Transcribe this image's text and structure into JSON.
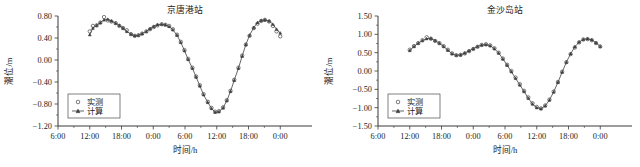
{
  "figure": {
    "panel_count": 2,
    "background": "#ffffff",
    "axis_color": "#3a3a3a",
    "curve_color": "#555555"
  },
  "chart_data": [
    {
      "type": "line",
      "title": "京唐港站",
      "xlabel": "时间/h",
      "ylabel": "潮位/m",
      "grid": false,
      "legend_position": "lower-left",
      "xlim": [
        0,
        48
      ],
      "ylim": [
        -1.2,
        0.8
      ],
      "yticks": [
        "0.80",
        "0.40",
        "0.00",
        "−0.40",
        "−0.80",
        "−1.20"
      ],
      "ytick_values": [
        0.8,
        0.4,
        0.0,
        -0.4,
        -0.8,
        -1.2
      ],
      "xticks": [
        "6:00",
        "12:00",
        "18:00",
        "0:00",
        "6:00",
        "12:00",
        "18:00",
        "0:00"
      ],
      "xtick_values": [
        0,
        6,
        12,
        18,
        24,
        30,
        36,
        42
      ],
      "series": [
        {
          "name": "实测",
          "marker": "open-circle",
          "style": "points",
          "x": [
            6.0,
            6.6,
            7.3,
            8.0,
            8.7,
            9.4,
            10.1,
            10.9,
            11.6,
            12.3,
            13.0,
            13.8,
            14.5,
            15.2,
            15.9,
            16.7,
            17.4,
            18.1,
            18.8,
            19.6,
            20.3,
            21.0,
            21.7,
            22.5,
            23.2,
            23.9,
            24.6,
            25.4,
            26.1,
            26.8,
            27.5,
            28.3,
            29.0,
            29.7,
            30.4,
            31.2,
            31.9,
            32.6,
            33.3,
            34.1,
            34.8,
            35.5,
            36.2,
            37.0,
            37.7,
            38.4,
            39.1,
            39.9,
            40.6,
            41.3,
            42.0
          ],
          "y": [
            0.52,
            0.62,
            0.63,
            0.68,
            0.78,
            0.72,
            0.7,
            0.67,
            0.62,
            0.58,
            0.54,
            0.47,
            0.44,
            0.45,
            0.48,
            0.52,
            0.56,
            0.6,
            0.63,
            0.65,
            0.64,
            0.62,
            0.56,
            0.46,
            0.33,
            0.18,
            0.02,
            -0.14,
            -0.3,
            -0.46,
            -0.62,
            -0.76,
            -0.87,
            -0.94,
            -0.93,
            -0.86,
            -0.73,
            -0.56,
            -0.36,
            -0.14,
            0.08,
            0.28,
            0.44,
            0.58,
            0.66,
            0.71,
            0.73,
            0.7,
            0.62,
            0.52,
            0.43
          ]
        },
        {
          "name": "计算",
          "marker": "filled-triangle",
          "style": "line-with-markers",
          "x": [
            6.0,
            6.6,
            7.3,
            8.0,
            8.7,
            9.4,
            10.1,
            10.9,
            11.6,
            12.3,
            13.0,
            13.8,
            14.5,
            15.2,
            15.9,
            16.7,
            17.4,
            18.1,
            18.8,
            19.6,
            20.3,
            21.0,
            21.7,
            22.5,
            23.2,
            23.9,
            24.6,
            25.4,
            26.1,
            26.8,
            27.5,
            28.3,
            29.0,
            29.7,
            30.4,
            31.2,
            31.9,
            32.6,
            33.3,
            34.1,
            34.8,
            35.5,
            36.2,
            37.0,
            37.7,
            38.4,
            39.1,
            39.9,
            40.6,
            41.3,
            42.0
          ],
          "y": [
            0.46,
            0.58,
            0.63,
            0.68,
            0.73,
            0.74,
            0.71,
            0.67,
            0.63,
            0.58,
            0.52,
            0.47,
            0.44,
            0.45,
            0.48,
            0.52,
            0.57,
            0.61,
            0.64,
            0.65,
            0.64,
            0.61,
            0.55,
            0.45,
            0.32,
            0.17,
            0.01,
            -0.15,
            -0.31,
            -0.47,
            -0.63,
            -0.77,
            -0.88,
            -0.95,
            -0.94,
            -0.87,
            -0.74,
            -0.57,
            -0.37,
            -0.15,
            0.07,
            0.28,
            0.45,
            0.59,
            0.68,
            0.72,
            0.73,
            0.71,
            0.65,
            0.56,
            0.49
          ]
        }
      ]
    },
    {
      "type": "line",
      "title": "金沙岛站",
      "xlabel": "时间/h",
      "ylabel": "潮位/m",
      "grid": false,
      "legend_position": "lower-left",
      "xlim": [
        0,
        48
      ],
      "ylim": [
        -1.5,
        1.5
      ],
      "yticks": [
        "1.50",
        "1.00",
        "0.50",
        "0.00",
        "−0.50",
        "−1.00",
        "−1.50"
      ],
      "ytick_values": [
        1.5,
        1.0,
        0.5,
        0.0,
        -0.5,
        -1.0,
        -1.5
      ],
      "xticks": [
        "6:00",
        "12:00",
        "18:00",
        "0:00",
        "6:00",
        "12:00",
        "18:00",
        "0:00"
      ],
      "xtick_values": [
        0,
        6,
        12,
        18,
        24,
        30,
        36,
        42
      ],
      "series": [
        {
          "name": "实测",
          "marker": "open-circle",
          "style": "points",
          "x": [
            6.0,
            6.8,
            7.6,
            8.4,
            9.2,
            10.0,
            10.8,
            11.6,
            12.4,
            13.2,
            14.0,
            14.8,
            15.6,
            16.4,
            17.2,
            18.0,
            18.8,
            19.6,
            20.4,
            21.2,
            22.0,
            22.8,
            23.6,
            24.4,
            25.2,
            26.0,
            26.8,
            27.6,
            28.4,
            29.2,
            30.0,
            30.8,
            31.6,
            32.4,
            33.2,
            34.0,
            34.8,
            35.6,
            36.4,
            37.2,
            38.0,
            38.8,
            39.6,
            40.4,
            41.2,
            42.0
          ],
          "y": [
            0.58,
            0.68,
            0.76,
            0.84,
            0.92,
            0.88,
            0.82,
            0.76,
            0.68,
            0.58,
            0.48,
            0.43,
            0.44,
            0.48,
            0.54,
            0.6,
            0.66,
            0.71,
            0.73,
            0.7,
            0.62,
            0.5,
            0.34,
            0.17,
            0.0,
            -0.18,
            -0.36,
            -0.54,
            -0.72,
            -0.88,
            -0.98,
            -1.02,
            -0.94,
            -0.78,
            -0.56,
            -0.3,
            -0.02,
            0.24,
            0.46,
            0.64,
            0.78,
            0.86,
            0.87,
            0.84,
            0.76,
            0.67
          ]
        },
        {
          "name": "计算",
          "marker": "filled-triangle",
          "style": "line-with-markers",
          "x": [
            6.0,
            6.8,
            7.6,
            8.4,
            9.2,
            10.0,
            10.8,
            11.6,
            12.4,
            13.2,
            14.0,
            14.8,
            15.6,
            16.4,
            17.2,
            18.0,
            18.8,
            19.6,
            20.4,
            21.2,
            22.0,
            22.8,
            23.6,
            24.4,
            25.2,
            26.0,
            26.8,
            27.6,
            28.4,
            29.2,
            30.0,
            30.8,
            31.6,
            32.4,
            33.2,
            34.0,
            34.8,
            35.6,
            36.4,
            37.2,
            38.0,
            38.8,
            39.6,
            40.4,
            41.2,
            42.0
          ],
          "y": [
            0.56,
            0.67,
            0.76,
            0.83,
            0.88,
            0.89,
            0.83,
            0.76,
            0.67,
            0.57,
            0.47,
            0.43,
            0.44,
            0.49,
            0.55,
            0.61,
            0.67,
            0.71,
            0.72,
            0.69,
            0.61,
            0.49,
            0.33,
            0.16,
            -0.02,
            -0.2,
            -0.38,
            -0.56,
            -0.74,
            -0.9,
            -1.0,
            -1.03,
            -0.95,
            -0.79,
            -0.57,
            -0.31,
            -0.03,
            0.24,
            0.47,
            0.66,
            0.79,
            0.86,
            0.88,
            0.85,
            0.77,
            0.67
          ]
        }
      ]
    }
  ]
}
